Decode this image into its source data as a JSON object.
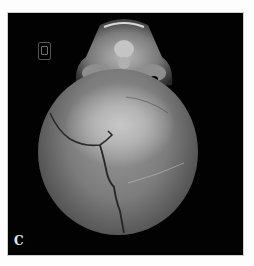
{
  "figure": {
    "panel_label": "C",
    "colors": {
      "background": "#020202",
      "bone_highlight": "#c8c8c8",
      "bone_shadow": "#4a4a4a",
      "page": "#fdfdfd"
    },
    "orientation_marker_icon": "orientation-cube-icon"
  }
}
